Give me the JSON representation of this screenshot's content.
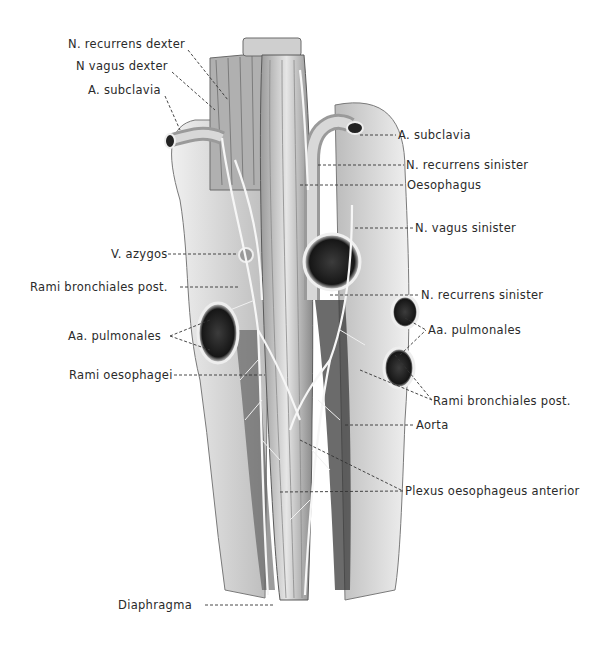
{
  "figure": {
    "colors": {
      "background": "#ffffff",
      "ink": "#2a2a2a",
      "tissue_light": "#d8d8d8",
      "tissue_dark": "#3a3a3a",
      "nerve": "#f4f4f4"
    }
  },
  "labels": {
    "left": [
      {
        "text": "N. recurrens dexter",
        "x": 68,
        "y": 44
      },
      {
        "text": "N vagus dexter",
        "x": 76,
        "y": 66
      },
      {
        "text": "A. subclavia",
        "x": 88,
        "y": 90
      },
      {
        "text": "V. azygos",
        "x": 111,
        "y": 248
      },
      {
        "text": "Rami bronchiales post.",
        "x": 30,
        "y": 282
      },
      {
        "text": "Aa. pulmonales",
        "x": 68,
        "y": 331
      },
      {
        "text": "Rami oesophagei",
        "x": 69,
        "y": 370
      },
      {
        "text": "Diaphragma",
        "x": 118,
        "y": 601
      }
    ],
    "right": [
      {
        "text": "A. subclavia",
        "x": 398,
        "y": 130
      },
      {
        "text": "N. recurrens sinister",
        "x": 406,
        "y": 160
      },
      {
        "text": "Oesophagus",
        "x": 407,
        "y": 180
      },
      {
        "text": "N. vagus sinister",
        "x": 415,
        "y": 222
      },
      {
        "text": "N. recurrens sinister",
        "x": 421,
        "y": 290
      },
      {
        "text": "Aa. pulmonales",
        "x": 428,
        "y": 325
      },
      {
        "text": "Rami bronchiales post.",
        "x": 433,
        "y": 396
      },
      {
        "text": "Aorta",
        "x": 416,
        "y": 420
      },
      {
        "text": "Plexus oesophageus anterior",
        "x": 405,
        "y": 486
      }
    ]
  }
}
